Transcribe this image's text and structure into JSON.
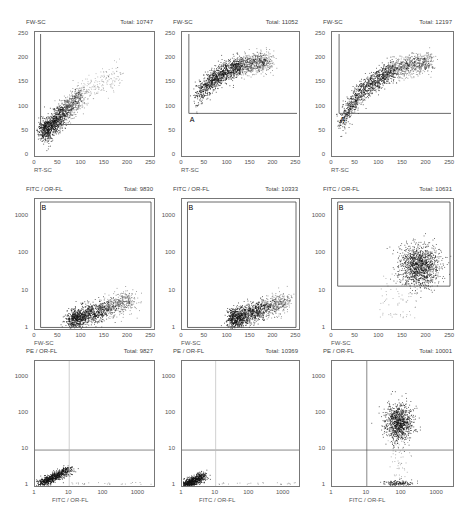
{
  "chart_data": [
    {
      "type": "scatter",
      "id": "r1c1",
      "ylabel": "FW-SC",
      "xlabel": "RT-SC",
      "total": "Total: 10747",
      "xticks": [
        "0",
        "50",
        "100",
        "150",
        "200",
        "250"
      ],
      "yticks": [
        "0",
        "50",
        "100",
        "150",
        "200",
        "250"
      ],
      "xscale": "linear",
      "yscale": "linear",
      "xlim": [
        0,
        256
      ],
      "ylim": [
        0,
        256
      ],
      "gate": {
        "label": "",
        "type": "L-region",
        "x": 12,
        "y": 65
      },
      "cluster": {
        "shape": "diagonal",
        "from": [
          20,
          50
        ],
        "to": [
          100,
          130
        ],
        "spread": [
          120,
          170
        ]
      }
    },
    {
      "type": "scatter",
      "id": "r1c2",
      "ylabel": "FW-SC",
      "xlabel": "RT-SC",
      "total": "Total: 11052",
      "xticks": [
        "0",
        "50",
        "100",
        "150",
        "200",
        "250"
      ],
      "yticks": [
        "0",
        "50",
        "100",
        "150",
        "200",
        "250"
      ],
      "xscale": "linear",
      "yscale": "linear",
      "xlim": [
        0,
        256
      ],
      "ylim": [
        0,
        256
      ],
      "gate": {
        "label": "A",
        "type": "L-region",
        "x": 15,
        "y": 88
      },
      "cluster": {
        "shape": "arc",
        "from": [
          35,
          110
        ],
        "to": [
          190,
          195
        ]
      }
    },
    {
      "type": "scatter",
      "id": "r1c3",
      "ylabel": "FW-SC",
      "xlabel": "RT-SC",
      "total": "Total: 12197",
      "xticks": [
        "0",
        "50",
        "100",
        "150",
        "200",
        "250"
      ],
      "yticks": [
        "0",
        "50",
        "100",
        "150",
        "200",
        "250"
      ],
      "xscale": "linear",
      "yscale": "linear",
      "xlim": [
        0,
        256
      ],
      "ylim": [
        0,
        256
      ],
      "gate": {
        "label": "A",
        "type": "L-region",
        "x": 15,
        "y": 88
      },
      "cluster": {
        "shape": "arc",
        "from": [
          20,
          45
        ],
        "to": [
          210,
          195
        ]
      }
    },
    {
      "type": "scatter",
      "id": "r2c1",
      "ylabel": "FITC / OR-FL",
      "xlabel": "FW-SC",
      "total": "Total: 9830",
      "xticks": [
        "0",
        "50",
        "100",
        "150",
        "200",
        "250"
      ],
      "yticks": [
        "1",
        "10",
        "100",
        "1000"
      ],
      "xscale": "linear",
      "yscale": "log",
      "xlim": [
        0,
        256
      ],
      "ylim": [
        1,
        3000
      ],
      "gate": {
        "label": "B",
        "type": "box",
        "x": 12,
        "y": 1.1
      },
      "cluster": {
        "shape": "diagonal",
        "from": [
          80,
          1.8
        ],
        "to": [
          210,
          6
        ]
      }
    },
    {
      "type": "scatter",
      "id": "r2c2",
      "ylabel": "FITC / OR-FL",
      "xlabel": "FW-SC",
      "total": "Total: 10333",
      "xticks": [
        "0",
        "50",
        "100",
        "150",
        "200",
        "250"
      ],
      "yticks": [
        "1",
        "10",
        "100",
        "1000"
      ],
      "xscale": "linear",
      "yscale": "log",
      "xlim": [
        0,
        256
      ],
      "ylim": [
        1,
        3000
      ],
      "gate": {
        "label": "B",
        "type": "box",
        "x": 12,
        "y": 1.1
      },
      "cluster": {
        "shape": "diagonal",
        "from": [
          110,
          1.8
        ],
        "to": [
          230,
          6
        ]
      }
    },
    {
      "type": "scatter",
      "id": "r2c3",
      "ylabel": "FITC / OR-FL",
      "xlabel": "FW-SC",
      "total": "Total: 10631",
      "xticks": [
        "0",
        "50",
        "100",
        "150",
        "200",
        "250"
      ],
      "yticks": [
        "1",
        "10",
        "100",
        "1000"
      ],
      "xscale": "linear",
      "yscale": "log",
      "xlim": [
        0,
        256
      ],
      "ylim": [
        1,
        3000
      ],
      "gate": {
        "label": "B",
        "type": "box",
        "x": 12,
        "y": 14
      },
      "cluster": {
        "shape": "blob",
        "center": [
          185,
          50
        ],
        "sd": [
          30,
          0.35
        ]
      }
    },
    {
      "type": "scatter",
      "id": "r3c1",
      "ylabel": "PE / OR-FL",
      "xlabel": "FITC / OR-FL",
      "total": "Total: 9827",
      "xticks": [
        "1",
        "10",
        "100",
        "1000"
      ],
      "yticks": [
        "1",
        "10",
        "100",
        "1000"
      ],
      "xscale": "log",
      "yscale": "log",
      "xlim": [
        1,
        3000
      ],
      "ylim": [
        1,
        3000
      ],
      "quadrant": {
        "x": 10,
        "y": 10,
        "vline_style": "faint"
      },
      "cluster": {
        "shape": "diagonal_log",
        "from": [
          1.5,
          1.2
        ],
        "to": [
          10,
          3
        ]
      }
    },
    {
      "type": "scatter",
      "id": "r3c2",
      "ylabel": "PE / OR-FL",
      "xlabel": "FITC / OR-FL",
      "total": "Total: 10369",
      "xticks": [
        "1",
        "10",
        "100",
        "1000"
      ],
      "yticks": [
        "1",
        "10",
        "100",
        "1000"
      ],
      "xscale": "log",
      "yscale": "log",
      "xlim": [
        1,
        3000
      ],
      "ylim": [
        1,
        3000
      ],
      "quadrant": {
        "x": 10,
        "y": 10,
        "vline_style": "faint"
      },
      "cluster": {
        "shape": "diagonal_log",
        "from": [
          1.3,
          1.1
        ],
        "to": [
          4,
          2
        ]
      }
    },
    {
      "type": "scatter",
      "id": "r3c3",
      "ylabel": "PE / OR-FL",
      "xlabel": "FITC / OR-FL",
      "total": "Total: 10001",
      "xticks": [
        "1",
        "10",
        "100",
        "1000"
      ],
      "yticks": [
        "1",
        "10",
        "100",
        "1000"
      ],
      "xscale": "log",
      "yscale": "log",
      "xlim": [
        1,
        3000
      ],
      "ylim": [
        1,
        3000
      ],
      "quadrant": {
        "x": 10,
        "y": 10,
        "vline_style": "solid"
      },
      "cluster": {
        "shape": "blob_log",
        "center": [
          80,
          60
        ],
        "sd": [
          0.18,
          0.25
        ],
        "secondary": {
          "center": [
            80,
            1.15
          ]
        }
      }
    }
  ]
}
